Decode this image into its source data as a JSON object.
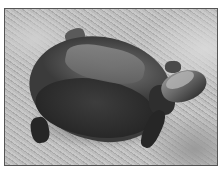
{
  "image": {
    "subject": "turtle on sandy ground",
    "style": "grayscale photograph",
    "alt": "A turtle walking on sand"
  }
}
